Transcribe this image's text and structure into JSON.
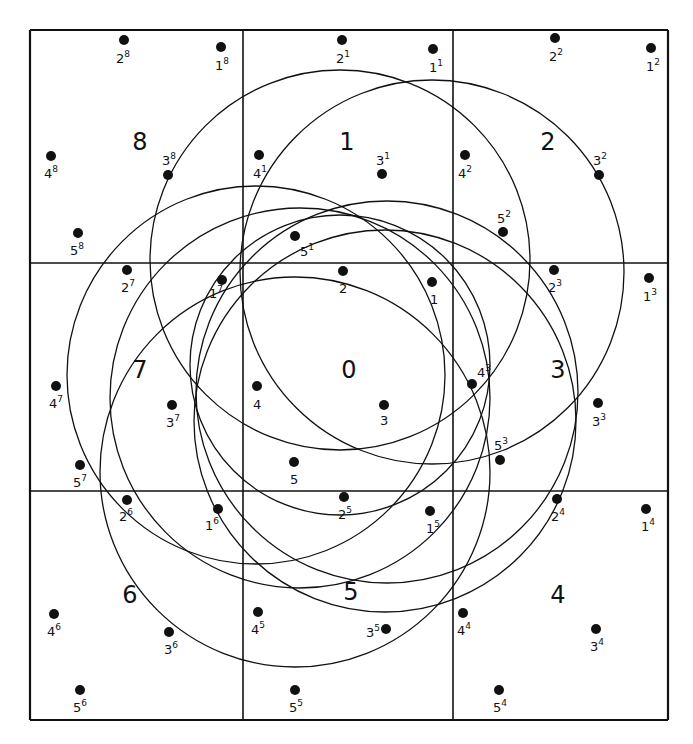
{
  "diagram": {
    "type": "3x3 grid of cells with sample points and overlapping circles",
    "grid": {
      "x": [
        30,
        243,
        453,
        668
      ],
      "y": [
        30,
        263,
        491,
        720
      ],
      "stroke": "#111111"
    },
    "cells": [
      {
        "id": "8",
        "label": "8",
        "x": 140,
        "y": 150
      },
      {
        "id": "1",
        "label": "1",
        "x": 347,
        "y": 150
      },
      {
        "id": "2",
        "label": "2",
        "x": 548,
        "y": 150
      },
      {
        "id": "7",
        "label": "7",
        "x": 140,
        "y": 378
      },
      {
        "id": "0",
        "label": "0",
        "x": 349,
        "y": 378
      },
      {
        "id": "3",
        "label": "3",
        "x": 558,
        "y": 378
      },
      {
        "id": "6",
        "label": "6",
        "x": 130,
        "y": 603
      },
      {
        "id": "5",
        "label": "5",
        "x": 351,
        "y": 600
      },
      {
        "id": "4",
        "label": "4",
        "x": 558,
        "y": 603
      }
    ],
    "points": [
      {
        "base": "2",
        "sup": "8",
        "x": 124,
        "y": 40,
        "lx": 116,
        "ly": 63
      },
      {
        "base": "1",
        "sup": "8",
        "x": 221,
        "y": 47,
        "lx": 215,
        "ly": 70
      },
      {
        "base": "3",
        "sup": "8",
        "x": 168,
        "y": 175,
        "lx": 162,
        "ly": 165
      },
      {
        "base": "4",
        "sup": "8",
        "x": 51,
        "y": 156,
        "lx": 44,
        "ly": 178
      },
      {
        "base": "5",
        "sup": "8",
        "x": 78,
        "y": 233,
        "lx": 70,
        "ly": 255
      },
      {
        "base": "2",
        "sup": "1",
        "x": 342,
        "y": 40,
        "lx": 336,
        "ly": 63
      },
      {
        "base": "1",
        "sup": "1",
        "x": 433,
        "y": 49,
        "lx": 429,
        "ly": 72
      },
      {
        "base": "3",
        "sup": "1",
        "x": 382,
        "y": 174,
        "lx": 376,
        "ly": 165
      },
      {
        "base": "4",
        "sup": "1",
        "x": 259,
        "y": 155,
        "lx": 253,
        "ly": 178
      },
      {
        "base": "5",
        "sup": "1",
        "x": 295,
        "y": 236,
        "lx": 300,
        "ly": 256
      },
      {
        "base": "2",
        "sup": "2",
        "x": 555,
        "y": 38,
        "lx": 549,
        "ly": 61
      },
      {
        "base": "1",
        "sup": "2",
        "x": 651,
        "y": 48,
        "lx": 646,
        "ly": 71
      },
      {
        "base": "3",
        "sup": "2",
        "x": 599,
        "y": 175,
        "lx": 593,
        "ly": 165
      },
      {
        "base": "4",
        "sup": "2",
        "x": 465,
        "y": 155,
        "lx": 458,
        "ly": 178
      },
      {
        "base": "5",
        "sup": "2",
        "x": 503,
        "y": 232,
        "lx": 497,
        "ly": 223
      },
      {
        "base": "2",
        "sup": "7",
        "x": 127,
        "y": 270,
        "lx": 121,
        "ly": 292
      },
      {
        "base": "1",
        "sup": "7",
        "x": 222,
        "y": 280,
        "lx": 209,
        "ly": 298
      },
      {
        "base": "3",
        "sup": "7",
        "x": 172,
        "y": 405,
        "lx": 166,
        "ly": 427
      },
      {
        "base": "4",
        "sup": "7",
        "x": 56,
        "y": 386,
        "lx": 49,
        "ly": 408
      },
      {
        "base": "5",
        "sup": "7",
        "x": 80,
        "y": 465,
        "lx": 73,
        "ly": 487
      },
      {
        "base": "2",
        "sup": "",
        "x": 343,
        "y": 271,
        "lx": 339,
        "ly": 293
      },
      {
        "base": "1",
        "sup": "",
        "x": 432,
        "y": 282,
        "lx": 430,
        "ly": 304
      },
      {
        "base": "3",
        "sup": "",
        "x": 384,
        "y": 405,
        "lx": 380,
        "ly": 425
      },
      {
        "base": "4",
        "sup": "",
        "x": 257,
        "y": 386,
        "lx": 253,
        "ly": 409
      },
      {
        "base": "5",
        "sup": "",
        "x": 294,
        "y": 462,
        "lx": 290,
        "ly": 484
      },
      {
        "base": "2",
        "sup": "3",
        "x": 554,
        "y": 270,
        "lx": 548,
        "ly": 292
      },
      {
        "base": "1",
        "sup": "3",
        "x": 649,
        "y": 278,
        "lx": 643,
        "ly": 301
      },
      {
        "base": "3",
        "sup": "3",
        "x": 598,
        "y": 403,
        "lx": 592,
        "ly": 426
      },
      {
        "base": "4",
        "sup": "3",
        "x": 472,
        "y": 384,
        "lx": 477,
        "ly": 377
      },
      {
        "base": "5",
        "sup": "3",
        "x": 500,
        "y": 460,
        "lx": 494,
        "ly": 450
      },
      {
        "base": "2",
        "sup": "6",
        "x": 127,
        "y": 500,
        "lx": 119,
        "ly": 521
      },
      {
        "base": "1",
        "sup": "6",
        "x": 218,
        "y": 509,
        "lx": 205,
        "ly": 530
      },
      {
        "base": "3",
        "sup": "6",
        "x": 169,
        "y": 632,
        "lx": 164,
        "ly": 654
      },
      {
        "base": "4",
        "sup": "6",
        "x": 54,
        "y": 614,
        "lx": 47,
        "ly": 636
      },
      {
        "base": "5",
        "sup": "6",
        "x": 80,
        "y": 690,
        "lx": 73,
        "ly": 712
      },
      {
        "base": "2",
        "sup": "5",
        "x": 344,
        "y": 497,
        "lx": 338,
        "ly": 519
      },
      {
        "base": "1",
        "sup": "5",
        "x": 430,
        "y": 511,
        "lx": 426,
        "ly": 533
      },
      {
        "base": "3",
        "sup": "5",
        "x": 386,
        "y": 629,
        "lx": 366,
        "ly": 637
      },
      {
        "base": "4",
        "sup": "5",
        "x": 258,
        "y": 612,
        "lx": 251,
        "ly": 634
      },
      {
        "base": "5",
        "sup": "5",
        "x": 295,
        "y": 690,
        "lx": 289,
        "ly": 712
      },
      {
        "base": "2",
        "sup": "4",
        "x": 557,
        "y": 499,
        "lx": 551,
        "ly": 521
      },
      {
        "base": "1",
        "sup": "4",
        "x": 646,
        "y": 509,
        "lx": 641,
        "ly": 531
      },
      {
        "base": "3",
        "sup": "4",
        "x": 596,
        "y": 629,
        "lx": 590,
        "ly": 651
      },
      {
        "base": "4",
        "sup": "4",
        "x": 463,
        "y": 613,
        "lx": 457,
        "ly": 635
      },
      {
        "base": "5",
        "sup": "4",
        "x": 499,
        "y": 690,
        "lx": 493,
        "ly": 712
      }
    ],
    "circles": [
      {
        "cx": 340,
        "cy": 260,
        "r": 190
      },
      {
        "cx": 432,
        "cy": 272,
        "r": 192
      },
      {
        "cx": 387,
        "cy": 392,
        "r": 191
      },
      {
        "cx": 385,
        "cy": 421,
        "r": 191
      },
      {
        "cx": 295,
        "cy": 472,
        "r": 195
      },
      {
        "cx": 300,
        "cy": 398,
        "r": 190
      },
      {
        "cx": 256,
        "cy": 375,
        "r": 189
      },
      {
        "cx": 340,
        "cy": 365,
        "r": 150
      }
    ]
  }
}
